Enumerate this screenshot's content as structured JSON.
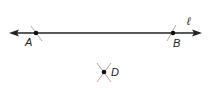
{
  "diagram": {
    "line": {
      "label": "ℓ",
      "color": "#222222"
    },
    "points": [
      {
        "id": "A",
        "label": "A",
        "x": 36,
        "y": 33
      },
      {
        "id": "B",
        "label": "B",
        "x": 173,
        "y": 33
      },
      {
        "id": "D",
        "label": "D",
        "x": 104,
        "y": 72
      }
    ],
    "arc_color": "#b88a8a"
  }
}
